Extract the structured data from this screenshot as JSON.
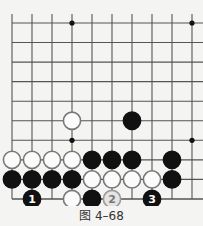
{
  "figure": {
    "caption": "图 4–68",
    "board": {
      "cols": 10,
      "rows": 10,
      "x0": 12,
      "dx": 20,
      "y0": 23,
      "dy": 19.55,
      "top_extend": 14,
      "right_edge": 203,
      "line_color": "#555555",
      "star_points": [
        [
          3,
          0
        ],
        [
          9,
          0
        ],
        [
          3,
          6
        ],
        [
          9,
          6
        ]
      ],
      "stones": [
        {
          "col": 3,
          "row": 5,
          "color": "white"
        },
        {
          "col": 6,
          "row": 5,
          "color": "black"
        },
        {
          "col": 0,
          "row": 7,
          "color": "white"
        },
        {
          "col": 1,
          "row": 7,
          "color": "white"
        },
        {
          "col": 2,
          "row": 7,
          "color": "white"
        },
        {
          "col": 3,
          "row": 7,
          "color": "white"
        },
        {
          "col": 4,
          "row": 7,
          "color": "black"
        },
        {
          "col": 5,
          "row": 7,
          "color": "black"
        },
        {
          "col": 6,
          "row": 7,
          "color": "black"
        },
        {
          "col": 8,
          "row": 7,
          "color": "black"
        },
        {
          "col": 0,
          "row": 8,
          "color": "black"
        },
        {
          "col": 1,
          "row": 8,
          "color": "black"
        },
        {
          "col": 2,
          "row": 8,
          "color": "black"
        },
        {
          "col": 3,
          "row": 8,
          "color": "black"
        },
        {
          "col": 4,
          "row": 8,
          "color": "white"
        },
        {
          "col": 5,
          "row": 8,
          "color": "white"
        },
        {
          "col": 6,
          "row": 8,
          "color": "white"
        },
        {
          "col": 7,
          "row": 8,
          "color": "white"
        },
        {
          "col": 8,
          "row": 8,
          "color": "black"
        },
        {
          "col": 1,
          "row": 9,
          "color": "black",
          "label": "1"
        },
        {
          "col": 3,
          "row": 9,
          "color": "white"
        },
        {
          "col": 4,
          "row": 9,
          "color": "black"
        },
        {
          "col": 5,
          "row": 9,
          "color": "gray",
          "label": "2"
        },
        {
          "col": 7,
          "row": 9,
          "color": "black",
          "label": "3"
        }
      ]
    }
  }
}
